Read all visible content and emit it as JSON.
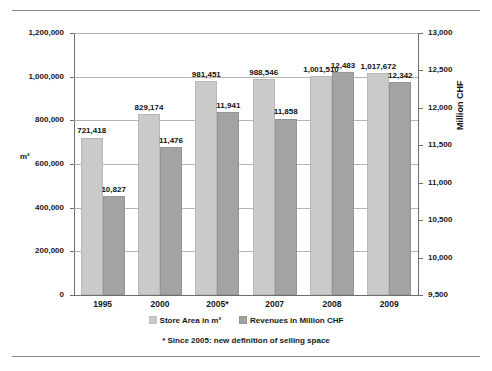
{
  "chart_data": {
    "type": "bar",
    "title": "",
    "subtitle": "",
    "categories": [
      "1995",
      "2000",
      "2005*",
      "2007",
      "2008",
      "2009"
    ],
    "series": [
      {
        "name": "Store Area in m²",
        "axis": "left",
        "color": "#cacaca",
        "values": [
          721418,
          829174,
          981451,
          988546,
          1001510,
          1017672
        ],
        "labels": [
          "721,418",
          "829,174",
          "981,451",
          "988,546",
          "1,001,510",
          "1,017,672"
        ]
      },
      {
        "name": "Revenues in Million CHF",
        "axis": "right",
        "color": "#a3a3a3",
        "values": [
          10827,
          11476,
          11941,
          11858,
          12483,
          12342
        ],
        "labels": [
          "10,827",
          "11,476",
          "11,941",
          "11,858",
          "12,483",
          "12,342"
        ]
      }
    ],
    "xlabel": "",
    "ylabel_left": "m²",
    "ylabel_right": "Million CHF",
    "ylim_left": [
      0,
      1200000
    ],
    "ylim_right": [
      9500,
      13000
    ],
    "yticks_left": [
      0,
      200000,
      400000,
      600000,
      800000,
      1000000,
      1200000
    ],
    "yticks_left_labels": [
      "0",
      "200,000",
      "400,000",
      "600,000",
      "800,000",
      "1,000,000",
      "1,200,000"
    ],
    "yticks_right": [
      9500,
      10000,
      10500,
      11000,
      11500,
      12000,
      12500,
      13000
    ],
    "yticks_right_labels": [
      "9,500",
      "10,000",
      "10,500",
      "11,000",
      "11,500",
      "12,000",
      "12,500",
      "13,000"
    ],
    "grid": true,
    "grid_axis": "y",
    "legend_position": "bottom",
    "annotations": [
      "* Since 2005: new definition of selling space"
    ]
  },
  "axes": {
    "left_title": "m²",
    "right_title": "Million CHF"
  },
  "legend": {
    "items": [
      {
        "label": "Store Area in m²",
        "swatch": "#cacaca"
      },
      {
        "label": "Revenues in Million CHF",
        "swatch": "#a3a3a3"
      }
    ]
  },
  "footnote": {
    "text": "* Since 2005: new definition of selling space"
  },
  "ytick_labels_left": [
    "1,200,000",
    "1,000,000",
    "800,000",
    "600,000",
    "400,000",
    "200,000",
    "0"
  ],
  "ytick_labels_right": [
    "13,000",
    "12,500",
    "12,000",
    "11,500",
    "11,000",
    "10,500",
    "10,000",
    "9,500"
  ],
  "xtick_labels": [
    "1995",
    "2000",
    "2005*",
    "2007",
    "2008",
    "2009"
  ]
}
